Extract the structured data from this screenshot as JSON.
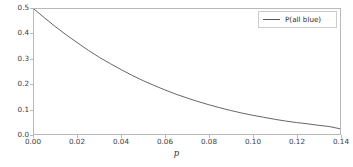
{
  "chart_data": {
    "type": "line",
    "title": "",
    "xlabel": "p",
    "ylabel": "",
    "xlim": [
      0.0,
      0.14
    ],
    "ylim": [
      0.0,
      0.5
    ],
    "grid": false,
    "legend_position": "upper right",
    "xticks": [
      "0.00",
      "0.02",
      "0.04",
      "0.06",
      "0.08",
      "0.10",
      "0.12",
      "0.14"
    ],
    "xtick_values": [
      0.0,
      0.02,
      0.04,
      0.06,
      0.08,
      0.1,
      0.12,
      0.14
    ],
    "yticks": [
      "0.0",
      "0.1",
      "0.2",
      "0.3",
      "0.4",
      "0.5"
    ],
    "ytick_values": [
      0.0,
      0.1,
      0.2,
      0.3,
      0.4,
      0.5
    ],
    "series": [
      {
        "name": "P(all blue)",
        "color": "#555555",
        "x": [
          0.0,
          0.005,
          0.01,
          0.015,
          0.02,
          0.025,
          0.03,
          0.035,
          0.04,
          0.045,
          0.05,
          0.055,
          0.06,
          0.065,
          0.07,
          0.075,
          0.08,
          0.085,
          0.09,
          0.095,
          0.1,
          0.105,
          0.11,
          0.115,
          0.12,
          0.125,
          0.13,
          0.135,
          0.14
        ],
        "values": [
          0.5,
          0.463,
          0.428,
          0.395,
          0.364,
          0.334,
          0.306,
          0.281,
          0.257,
          0.234,
          0.213,
          0.194,
          0.176,
          0.159,
          0.144,
          0.13,
          0.117,
          0.105,
          0.094,
          0.084,
          0.075,
          0.067,
          0.059,
          0.052,
          0.046,
          0.041,
          0.035,
          0.03,
          0.021
        ]
      }
    ]
  },
  "legend": {
    "entries": [
      {
        "label": "P(all blue)",
        "color": "#555555"
      }
    ]
  },
  "axis": {
    "xlabel": "p",
    "spine_color": "#b9b9b9",
    "tick_label_color": "#3b3b3b"
  },
  "figure": {
    "background": "#ffffff",
    "width": 353,
    "height": 167
  }
}
